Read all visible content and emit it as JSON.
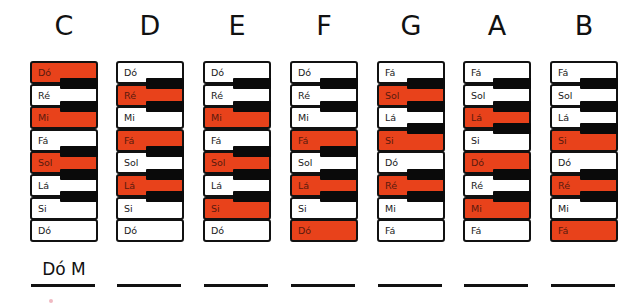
{
  "colors": {
    "highlight": "#e8421b",
    "white_key": "#ffffff",
    "black_key": "#0a0a0a",
    "outline": "#111111"
  },
  "columns": [
    {
      "heading": "C",
      "keys": [
        "Dó",
        "Ré",
        "Mi",
        "Fá",
        "Sol",
        "Lá",
        "Si",
        "Dó"
      ],
      "highlighted": [
        0,
        2,
        4
      ],
      "black_after": [
        0,
        1,
        3,
        4,
        5
      ],
      "answer": "Dó M"
    },
    {
      "heading": "D",
      "keys": [
        "Dó",
        "Ré",
        "Mi",
        "Fá",
        "Sol",
        "Lá",
        "Si",
        "Dó"
      ],
      "highlighted": [
        1,
        3,
        5
      ],
      "black_after": [
        0,
        1,
        3,
        4,
        5
      ],
      "answer": ""
    },
    {
      "heading": "E",
      "keys": [
        "Dó",
        "Ré",
        "Mi",
        "Fá",
        "Sol",
        "Lá",
        "Si",
        "Dó"
      ],
      "highlighted": [
        2,
        4,
        6
      ],
      "black_after": [
        0,
        1,
        3,
        4,
        5
      ],
      "answer": ""
    },
    {
      "heading": "F",
      "keys": [
        "Dó",
        "Ré",
        "Mi",
        "Fá",
        "Sol",
        "Lá",
        "Si",
        "Dó"
      ],
      "highlighted": [
        3,
        5,
        7
      ],
      "black_after": [
        0,
        1,
        3,
        4,
        5
      ],
      "answer": ""
    },
    {
      "heading": "G",
      "keys": [
        "Fá",
        "Sol",
        "Lá",
        "Si",
        "Dó",
        "Ré",
        "Mi",
        "Fá"
      ],
      "highlighted": [
        1,
        3,
        5
      ],
      "black_after": [
        0,
        1,
        2,
        4,
        5
      ],
      "answer": ""
    },
    {
      "heading": "A",
      "keys": [
        "Fá",
        "Sol",
        "Lá",
        "Si",
        "Dó",
        "Ré",
        "Mi",
        "Fá"
      ],
      "highlighted": [
        2,
        4,
        6
      ],
      "black_after": [
        0,
        1,
        2,
        4,
        5
      ],
      "answer": ""
    },
    {
      "heading": "B",
      "keys": [
        "Fá",
        "Sol",
        "Lá",
        "Si",
        "Dó",
        "Ré",
        "Mi",
        "Fá"
      ],
      "highlighted": [
        3,
        5,
        7
      ],
      "black_after": [
        0,
        1,
        2,
        4,
        5
      ],
      "answer": ""
    }
  ]
}
